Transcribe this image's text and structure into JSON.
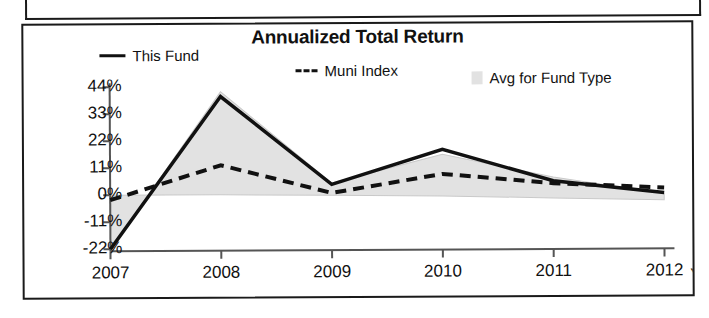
{
  "chart_data": {
    "type": "line",
    "title": "Annualized Total Return",
    "xlabel": "",
    "ylabel": "",
    "x": [
      "2007",
      "2008",
      "2009",
      "2010",
      "2011",
      "2012"
    ],
    "categories": [
      "2007",
      "2008",
      "2009",
      "2010",
      "2011",
      "2012"
    ],
    "xtick_labels": [
      "2007",
      "2008",
      "2009",
      "2010",
      "2011",
      "2012"
    ],
    "xtick_suffix": "YTD",
    "ytick_labels": [
      "44%",
      "33%",
      "22%",
      "11%",
      "0%",
      "-11%",
      "-22%"
    ],
    "ytick_values": [
      44,
      33,
      22,
      11,
      0,
      -11,
      -22
    ],
    "ylim": [
      -22,
      44
    ],
    "grid": false,
    "legend_position": "top",
    "series": [
      {
        "name": "This Fund",
        "style": "solid",
        "color": "#111111",
        "values": [
          -22,
          40,
          4,
          18,
          5,
          0
        ]
      },
      {
        "name": "Muni Index",
        "style": "dashed",
        "color": "#111111",
        "values": [
          -2,
          12,
          0.5,
          8,
          4,
          2
        ]
      },
      {
        "name": "Avg for Fund Type",
        "style": "band",
        "color": "#e2e2e2",
        "upper_values": [
          -22,
          42,
          4.5,
          16,
          6.5,
          -0.5
        ],
        "lower_values": [
          0,
          0,
          -0.5,
          -1,
          -2,
          -3
        ]
      }
    ]
  },
  "chart": {
    "title": "Annualized Total Return",
    "legend": [
      {
        "label": "This Fund",
        "marker": "solid-line-swatch"
      },
      {
        "label": "Muni Index",
        "marker": "dashed-line-swatch"
      },
      {
        "label": "Avg for Fund Type",
        "marker": "area-swatch"
      }
    ],
    "ytd_note": "YTD"
  }
}
